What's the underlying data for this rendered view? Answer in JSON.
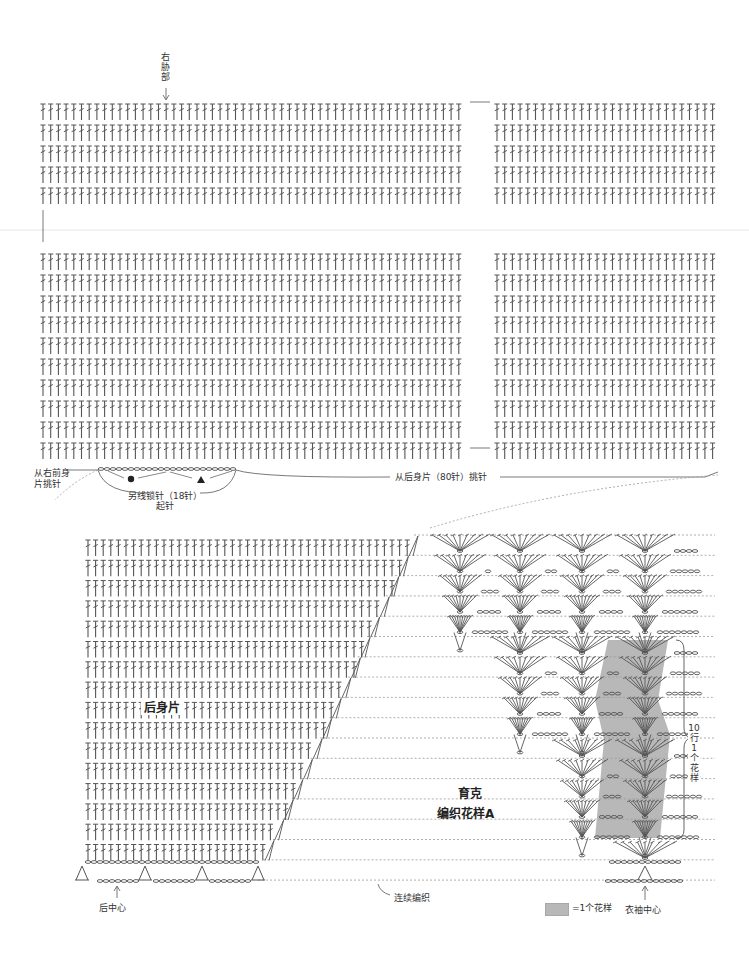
{
  "colors": {
    "stitch": "#555555",
    "dotted": "#9a9a9a",
    "shade": "#b8b8b8",
    "text": "#333333",
    "divider": "#e6e6e6"
  },
  "top_chart": {
    "side_label": "右胁部",
    "pickup_front_label": "从右前身片挑针",
    "pickup_front_line1": "从右前身",
    "pickup_front_line2": "片挑针",
    "chain_label": "另线锁针（18针）",
    "chain_label2": "起针",
    "pickup_back_label": "从后身片（80针）挑针",
    "marker_circle": "●",
    "marker_triangle": "▲",
    "upper_block": {
      "row_y_start": 104,
      "row_count": 5,
      "row_pitch": 21
    },
    "lower_block": {
      "row_y_start": 254,
      "row_count": 10,
      "row_pitch": 21
    },
    "left_columns": {
      "x_start": 43,
      "x_end": 465,
      "pitch": 7.7
    },
    "right_columns": {
      "x_start": 497,
      "x_end": 718,
      "pitch": 7.7
    }
  },
  "bottom_chart": {
    "back_body_label": "后身片",
    "yoke_label": "育克",
    "pattern_label": "编织花样A",
    "continuous_label": "连续编织",
    "back_center_label": "后中心",
    "sleeve_center_label": "衣袖中心",
    "repeat_bracket_label": [
      "10",
      "行",
      "1",
      "个",
      "花",
      "样"
    ],
    "legend_label": "=1个花样",
    "rows": {
      "y_start": 540,
      "count": 16,
      "pitch": 20.3
    },
    "stitch_x_start": 88,
    "stitch_pitch": 7.6,
    "fan_columns_x": [
      460,
      520,
      582,
      645
    ],
    "fan_rows_top": 535,
    "fan_rows_mid": 637,
    "fan_rows_low": 740
  }
}
